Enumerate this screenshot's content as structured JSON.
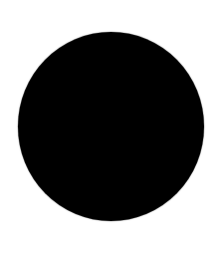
{
  "scene": {
    "description": "Solid black circle on white background",
    "background_color": "#ffffff",
    "shapes": [
      {
        "type": "circle",
        "fill": "#000000",
        "center": [
          111,
          126
        ],
        "diameter": 187
      }
    ]
  }
}
